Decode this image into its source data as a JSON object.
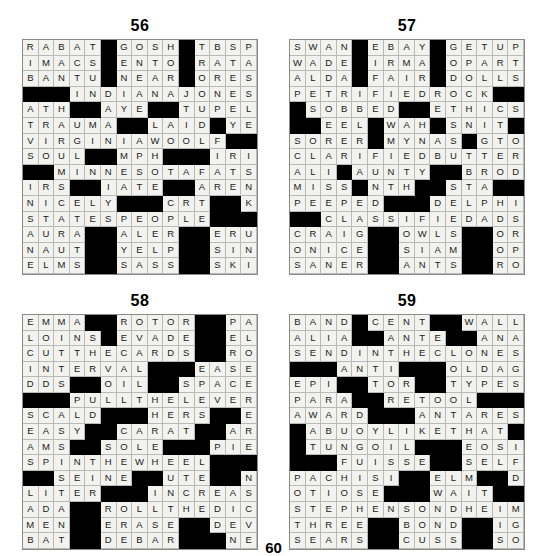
{
  "page": {
    "footer_number": "60"
  },
  "puzzles": [
    {
      "number": "56",
      "rows": [
        "RABAT#GOSH#TBSP",
        "IMACS#ENTO#RATA",
        "BANTU#NEAR#ORES",
        "###INDIANAJONES",
        "ATH##AYE##TUPELO",
        "TRAUMA##LAID#YEN",
        "VIRGINIAWOOLF##",
        "SOUL##MPH###IRIS",
        "##MINNESOTAFATS",
        "IRS##IATE##ARENOT",
        "NICELY###CRT##KOS",
        "STATESPEOPLE###",
        "AURA##ALER##ERUPT",
        "NAUT##YELP##SINAI",
        "ELMS##SASS##SKILL"
      ]
    },
    {
      "number": "57",
      "rows": [
        "SWAN#EBAY#GETUP",
        "WADE#IRMA#OPART",
        "ALDA#FAIR#DOLLS",
        "PETRIFIEDROCK##",
        "#SOBBED##ETHICS",
        "##EEL#WAH#SNIT",
        "SORER#MYNAS#GTO",
        "CLARIFIEDBUTTER",
        "ALI#AUNTY##BRODY",
        "MISS#NTH##STA###",
        "PEEPED###DELPHI",
        "##CLASSIFIEDADS",
        "CRAIG##OWLS##OREO",
        "ONICE##SIAM##OPAL",
        "SANER##ANTS##ROLE"
      ]
    },
    {
      "number": "58",
      "rows": [
        "EMMA##ROTOR##PAL",
        "LOINS#EVADE##ELI",
        "CUTTHECARDS##ROE",
        "INTERVAL###EASED",
        "DDS##OIL##SPACE##",
        "###PULLTHELEVER",
        "SCALD###HERS##EMU",
        "EASY##CARAT##ARID",
        "AMS##SOLE###PIETY",
        "SPINTHEWHEEL####",
        "##SEINE##UTE##NAT",
        "LITER###INCREASE",
        "ADA##ROLLTHEDICE",
        "MEN##ERASE##DEVON",
        "BAT##DEBAR###NETS"
      ]
    },
    {
      "number": "59",
      "rows": [
        "BAND#CENT##WALLA",
        "ALIA##ANTE##ANAIS",
        "SENDINTHECLONES",
        "###ANTI###OLDAGE",
        "EPI##TOR##TYPESET",
        "PARA##RETOOL####",
        "AWARD###ANTARES",
        "#ABUOYLIKETHAT#",
        "#TUNGOIL###EOSIN",
        "###FUISSE##SELF",
        "PACHISI##ELM##DEL",
        "OTIOSE###WAIT###",
        "STEPHENSONDHEIM",
        "THREE##BOND##IGOR",
        "SEARS##CUSS##SONS"
      ]
    }
  ]
}
